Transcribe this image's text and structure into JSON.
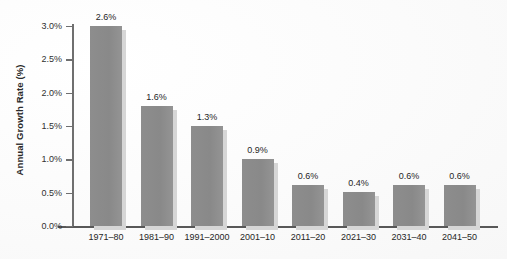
{
  "chart_data": {
    "type": "bar",
    "title": "",
    "xlabel": "",
    "ylabel": "Annual Growth Rate (%)",
    "categories": [
      "1971–80",
      "1981–90",
      "1991–2000",
      "2001–10",
      "2011–20",
      "2021–30",
      "2031–40",
      "2041–50"
    ],
    "values": [
      2.6,
      1.6,
      1.3,
      0.9,
      0.6,
      0.4,
      0.6,
      0.6
    ],
    "value_labels": [
      "2.6%",
      "1.6%",
      "1.3%",
      "0.9%",
      "0.6%",
      "0.4%",
      "0.6%",
      "0.6%"
    ],
    "drawn_values": [
      3.0,
      1.8,
      1.5,
      1.0,
      0.61,
      0.51,
      0.61,
      0.61
    ],
    "ylim": [
      0.0,
      3.0
    ],
    "ytick_values": [
      0.0,
      0.5,
      1.0,
      1.5,
      2.0,
      2.5,
      3.0
    ],
    "ytick_labels": [
      "0.0%",
      "0.5%",
      "1.0%",
      "1.5%",
      "2.0%",
      "2.5%",
      "3.0%"
    ],
    "grid": false,
    "legend": null,
    "bar_color": "#8d8d8d",
    "bar_shadow_color": "#d6d6d6",
    "axis_color": "#6f6f6f",
    "text_color": "#262626",
    "background_color": "#fbfbfb"
  }
}
